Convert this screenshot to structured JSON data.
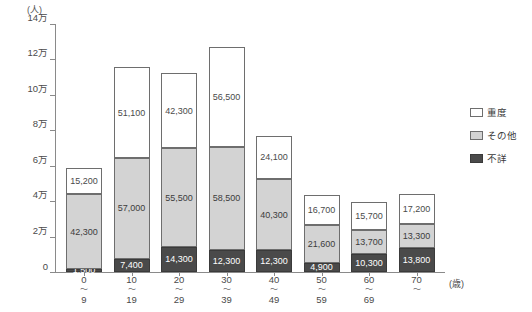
{
  "chart_data": {
    "type": "bar",
    "stacked": true,
    "title": "",
    "xlabel": "(歳)",
    "ylabel": "(人)",
    "ylim": [
      0,
      140000
    ],
    "ytick_labels": [
      "14万",
      "12万",
      "10万",
      "8万",
      "6万",
      "4万",
      "2万",
      "0"
    ],
    "ytick_values": [
      140000,
      120000,
      100000,
      80000,
      60000,
      40000,
      20000,
      0
    ],
    "grid": false,
    "legend_position": "right",
    "categories": [
      "0〜9",
      "10〜19",
      "20〜29",
      "30〜39",
      "40〜49",
      "50〜59",
      "60〜69",
      "70〜"
    ],
    "category_parts": [
      {
        "from": "0",
        "sep": "〜",
        "to": "9"
      },
      {
        "from": "10",
        "sep": "〜",
        "to": "19"
      },
      {
        "from": "20",
        "sep": "〜",
        "to": "29"
      },
      {
        "from": "30",
        "sep": "〜",
        "to": "39"
      },
      {
        "from": "40",
        "sep": "〜",
        "to": "49"
      },
      {
        "from": "50",
        "sep": "〜",
        "to": "59"
      },
      {
        "from": "60",
        "sep": "〜",
        "to": "69"
      },
      {
        "from": "70",
        "sep": "〜",
        "to": ""
      }
    ],
    "series": [
      {
        "name": "不詳",
        "color": "#4a4a4a",
        "values": [
          1500,
          7400,
          14300,
          12300,
          12300,
          4900,
          10300,
          13800
        ],
        "labels": [
          "1,500",
          "7,400",
          "14,300",
          "12,300",
          "12,300",
          "4,900",
          "10,300",
          "13,800"
        ]
      },
      {
        "name": "その他",
        "color": "#d3d3d3",
        "values": [
          42300,
          57000,
          55500,
          58500,
          40300,
          21600,
          13700,
          13300
        ],
        "labels": [
          "42,300",
          "57,000",
          "55,500",
          "58,500",
          "40,300",
          "21,600",
          "13,700",
          "13,300"
        ]
      },
      {
        "name": "重度",
        "color": "#ffffff",
        "values": [
          15200,
          51100,
          42300,
          56500,
          24100,
          16700,
          15700,
          17200
        ],
        "labels": [
          "15,200",
          "51,100",
          "42,300",
          "56,500",
          "24,100",
          "16,700",
          "15,700",
          "17,200"
        ]
      }
    ],
    "totals": [
      59000,
      115500,
      112100,
      127300,
      76700,
      43200,
      39700,
      44300
    ],
    "legend": [
      {
        "label": "重度",
        "color": "#ffffff"
      },
      {
        "label": "その他",
        "color": "#d3d3d3"
      },
      {
        "label": "不詳",
        "color": "#4a4a4a"
      }
    ]
  }
}
